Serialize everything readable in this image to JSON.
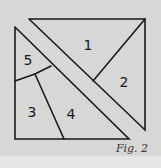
{
  "figure": {
    "caption": "Fig. 2",
    "colors": {
      "background": "#d7d7d5",
      "stroke": "#1a1a1a"
    },
    "pieces": [
      {
        "id": "1",
        "label": "1"
      },
      {
        "id": "2",
        "label": "2"
      },
      {
        "id": "3",
        "label": "3"
      },
      {
        "id": "4",
        "label": "4"
      },
      {
        "id": "5",
        "label": "5"
      }
    ]
  }
}
